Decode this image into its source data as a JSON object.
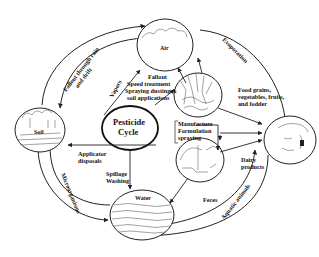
{
  "diagram": {
    "title": "Pesticide Cycle",
    "center": {
      "label_line1": "Pesticide",
      "label_line2": "Cycle"
    },
    "nodes": {
      "air": {
        "label": "Air"
      },
      "soil": {
        "label": "Soil"
      },
      "water": {
        "label": "Water"
      },
      "crops": {
        "label": ""
      },
      "human": {
        "label": ""
      },
      "dairy": {
        "label": ""
      }
    },
    "edge_labels": {
      "fallout_rain": {
        "line1": "Fallout through rain",
        "line2": "and drift"
      },
      "vapors": "Vapors",
      "fallout_block": {
        "line1": "Fallout",
        "line2": "Speed treatment",
        "line3": "Spraying dusting &",
        "line4": "soil applications"
      },
      "evaporation": "Evaporation",
      "food": {
        "line1": "Food grains,",
        "line2": "vegetables, fruits,",
        "line3": "and fodder"
      },
      "manufacture": {
        "line1": "Manufacture",
        "line2": "Formulation",
        "line3": "spraying"
      },
      "applicator": {
        "line1": "Applicator",
        "line2": "disposals"
      },
      "spillage": {
        "line1": "Spillage",
        "line2": "Washing"
      },
      "microorganisms": "Microorganisms",
      "dairy_products": {
        "line1": "Dairy",
        "line2": "products"
      },
      "feces": "Feces",
      "aquatic_animals": "Aquatic animals"
    }
  }
}
